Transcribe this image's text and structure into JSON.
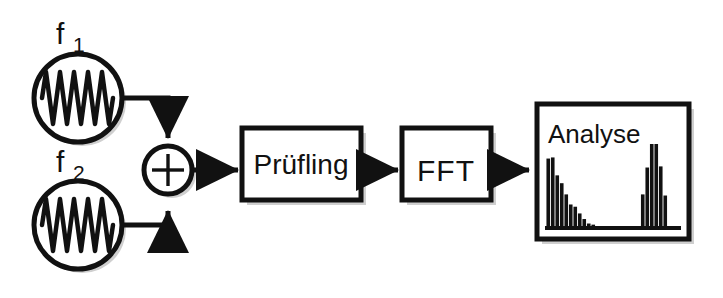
{
  "diagram": {
    "background_color": "#ffffff",
    "stroke_color": "#111111",
    "shadow_color": "#cccccc",
    "sources": [
      {
        "id": "source-1",
        "label": "f",
        "subscript": "1",
        "icon": "sine-wave-icon",
        "cycles": 5
      },
      {
        "id": "source-2",
        "label": "f",
        "subscript": "2",
        "icon": "sine-wave-icon",
        "cycles": 5
      }
    ],
    "adder": {
      "id": "summing-junction",
      "symbol": "+",
      "icon": "plus-icon"
    },
    "blocks": [
      {
        "id": "block-pruefling",
        "label": "Prüfling",
        "font_size": 28
      },
      {
        "id": "block-fft",
        "label": "FFT",
        "font_size": 28
      },
      {
        "id": "block-analyse",
        "label": "Analyse",
        "font_size": 26
      }
    ],
    "connectors": [
      {
        "id": "conn-f1-adder",
        "from": "source-1",
        "to": "summing-junction",
        "arrow": "down"
      },
      {
        "id": "conn-f2-adder",
        "from": "source-2",
        "to": "summing-junction",
        "arrow": "up"
      },
      {
        "id": "conn-adder-pruefling",
        "from": "summing-junction",
        "to": "block-pruefling",
        "arrow": "right"
      },
      {
        "id": "conn-pruefling-fft",
        "from": "block-pruefling",
        "to": "block-fft",
        "arrow": "right"
      },
      {
        "id": "conn-fft-analyse",
        "from": "block-fft",
        "to": "block-analyse",
        "arrow": "right"
      }
    ]
  },
  "chart_data": {
    "type": "bar",
    "title": "Analyse",
    "xlabel": "",
    "ylabel": "",
    "grid": false,
    "legend": null,
    "axis_baseline": true,
    "ylim": [
      0,
      100
    ],
    "categories": [
      "1",
      "2",
      "3",
      "4",
      "5",
      "6",
      "7",
      "8",
      "9",
      "10",
      "11",
      "12",
      "13",
      "14",
      "15",
      "16",
      "17",
      "18",
      "19",
      "20",
      "21",
      "22",
      "23",
      "24",
      "25",
      "26",
      "27",
      "28",
      "29",
      "30"
    ],
    "values": [
      62,
      63,
      47,
      40,
      30,
      21,
      19,
      13,
      8,
      4,
      3,
      0,
      0,
      0,
      0,
      0,
      0,
      0,
      0,
      0,
      0,
      30,
      54,
      75,
      75,
      55,
      29,
      0,
      0,
      0
    ],
    "bar_color": "#111111"
  }
}
